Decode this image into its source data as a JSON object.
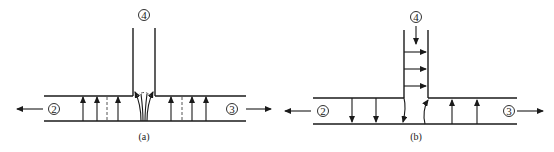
{
  "figure": {
    "panels": [
      {
        "id": "a",
        "caption": "(a)",
        "ports": {
          "left": "2",
          "right": "3",
          "top": "4"
        },
        "description": "Flow from main pipe into branch: upward velocity arrows along main pipe, converging into branch 4"
      },
      {
        "id": "b",
        "caption": "(b)",
        "ports": {
          "left": "2",
          "right": "3",
          "top": "4"
        },
        "description": "Flow entering from branch 4 downward, horizontal arrows in branch, downward arrows on left side and upward arrows on right side of main pipe"
      }
    ],
    "colors": {
      "line": "#1a1a1a",
      "background": "#ffffff"
    }
  }
}
